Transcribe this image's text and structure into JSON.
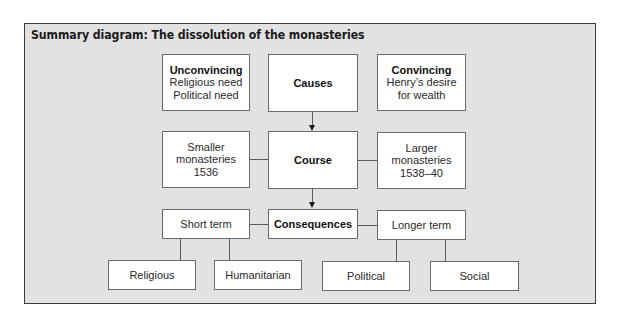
{
  "title": "Summary diagram: The dissolution of the monasteries",
  "colors": {
    "panel_background": "#e2e2e2",
    "box_background": "#ffffff",
    "border": "#6a6a6a",
    "text": "#2a2a2a"
  },
  "causes": {
    "label": "Causes",
    "unconvincing": {
      "heading": "Unconvincing",
      "lines": [
        "Religious need",
        "Political need"
      ]
    },
    "convincing": {
      "heading": "Convincing",
      "lines": [
        "Henry’s desire",
        "for wealth"
      ]
    }
  },
  "course": {
    "label": "Course",
    "smaller": {
      "lines": [
        "Smaller",
        "monasteries",
        "1536"
      ]
    },
    "larger": {
      "lines": [
        "Larger",
        "monasteries",
        "1538–40"
      ]
    }
  },
  "consequences": {
    "label": "Consequences",
    "short_term": {
      "label": "Short term",
      "children": [
        "Religious",
        "Humanitarian"
      ]
    },
    "longer_term": {
      "label": "Longer term",
      "children": [
        "Political",
        "Social"
      ]
    }
  }
}
